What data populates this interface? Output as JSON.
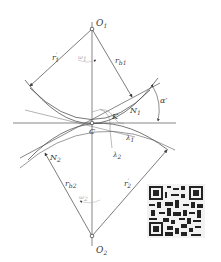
{
  "figure": {
    "type": "involute gear meshing geometry",
    "colors": {
      "line": "#4a4a4a",
      "light_line": "#9a9a9a",
      "background": "#ffffff"
    },
    "points": {
      "O1": {
        "label": "O",
        "sub": "1"
      },
      "O2": {
        "label": "O",
        "sub": "2"
      },
      "C": {
        "label": "C"
      },
      "K": {
        "label": "K"
      },
      "N1": {
        "label": "N",
        "sub": "1"
      },
      "N2": {
        "label": "N",
        "sub": "2"
      }
    },
    "radii": {
      "r1p": {
        "label": "r",
        "sub": "1",
        "sup": "′"
      },
      "rb1": {
        "label": "r",
        "sub": "b1"
      },
      "rb2": {
        "label": "r",
        "sub": "b2"
      },
      "r2p": {
        "label": "r",
        "sub": "2",
        "sup": "′"
      }
    },
    "angles": {
      "alpha": {
        "label": "α′"
      },
      "omega1": {
        "label": "ω",
        "sub": "1"
      },
      "omega2": {
        "label": "ω",
        "sub": "2"
      },
      "lambda1": {
        "label": "λ",
        "sub": "1"
      },
      "lambda2": {
        "label": "λ",
        "sub": "2"
      }
    }
  },
  "qr_code": {
    "present": true
  }
}
